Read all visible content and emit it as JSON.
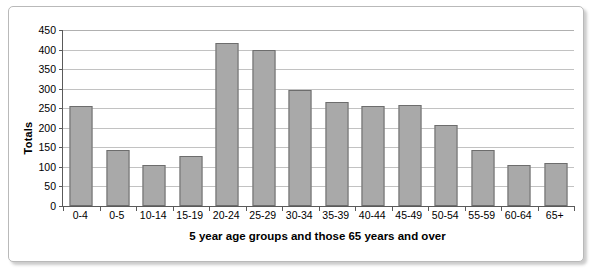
{
  "chart_data": {
    "type": "bar",
    "title": "",
    "xlabel": "5 year age groups and those 65 years and over",
    "ylabel": "Totals",
    "categories": [
      "0-4",
      "0-5",
      "10-14",
      "15-19",
      "20-24",
      "25-29",
      "30-34",
      "35-39",
      "40-44",
      "45-49",
      "50-54",
      "55-59",
      "60-64",
      "65+"
    ],
    "values": [
      255,
      143,
      106,
      127,
      417,
      400,
      296,
      267,
      255,
      258,
      207,
      142,
      105,
      111
    ],
    "ylim": [
      0,
      450
    ],
    "ytick_labels": [
      "0",
      "50",
      "100",
      "150",
      "200",
      "250",
      "300",
      "350",
      "400",
      "450"
    ],
    "ytick_values": [
      0,
      50,
      100,
      150,
      200,
      250,
      300,
      350,
      400,
      450
    ],
    "grid": "horizontal",
    "legend": "none",
    "bar_color": "#a9a9a9",
    "bar_edge_color": "#6d6d6d",
    "gridline_color": "#c2c2c2",
    "axis_color": "#5a5a5a",
    "frame_color": "#b9b9b9",
    "background_color": "#ffffff"
  }
}
